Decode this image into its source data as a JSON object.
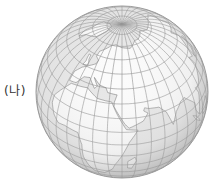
{
  "figure": {
    "label": "(나)",
    "type": "orthographic globe projection",
    "globe": {
      "cx": 122,
      "cy": 92,
      "r": 86,
      "center_lat": 38,
      "center_lon": 40
    },
    "graticule_step_deg": 10,
    "colors": {
      "ocean": "#e6e6e6",
      "land": "#fbfbfb",
      "grid": "#8a8a8a",
      "outline": "#9a9a9a",
      "coast": "#777777",
      "label": "#333333"
    },
    "regions_visible": [
      "Europe",
      "Africa",
      "Asia",
      "Arctic",
      "Indian Ocean",
      "Atlantic Ocean"
    ]
  }
}
